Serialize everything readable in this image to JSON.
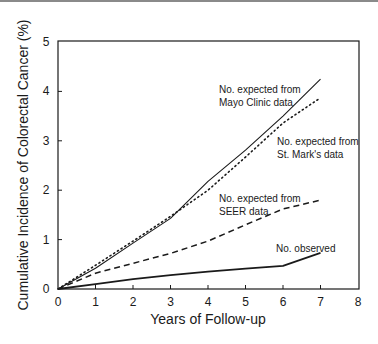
{
  "chart_data": {
    "type": "line",
    "title": "",
    "xlabel": "Years of Follow-up",
    "ylabel": "Cumulative Incidence of Colorectal Cancer (%)",
    "xlim": [
      0,
      8
    ],
    "ylim": [
      0,
      5
    ],
    "xticks": [
      0,
      1,
      2,
      3,
      4,
      5,
      6,
      7,
      8
    ],
    "yticks": [
      0,
      1,
      2,
      3,
      4,
      5
    ],
    "grid": false,
    "legend": "inline annotations",
    "x": [
      0,
      1,
      2,
      3,
      4,
      5,
      6,
      7
    ],
    "series": [
      {
        "name": "No. expected from Mayo Clinic data",
        "style": "solid-thin",
        "values": [
          0,
          0.42,
          0.93,
          1.43,
          2.18,
          2.81,
          3.5,
          4.25
        ]
      },
      {
        "name": "No. expected from St. Mark's data",
        "style": "dotted",
        "values": [
          0,
          0.48,
          0.97,
          1.47,
          2.0,
          2.67,
          3.36,
          3.87
        ]
      },
      {
        "name": "No. expected from SEER data",
        "style": "dashed",
        "values": [
          0,
          0.32,
          0.52,
          0.72,
          0.97,
          1.3,
          1.62,
          1.8
        ]
      },
      {
        "name": "No. observed",
        "style": "solid-thick",
        "values": [
          0,
          0.1,
          0.2,
          0.28,
          0.35,
          0.41,
          0.47,
          0.73
        ]
      }
    ],
    "annotations": [
      {
        "lines": [
          "No. expected from",
          "Mayo Clinic data"
        ],
        "x": 219,
        "y": 93
      },
      {
        "lines": [
          "No. expected from",
          "St. Mark's data"
        ],
        "x": 277,
        "y": 145
      },
      {
        "lines": [
          "No. expected from",
          "SEER data"
        ],
        "x": 219,
        "y": 202
      },
      {
        "lines": [
          "No. observed"
        ],
        "x": 276,
        "y": 252
      }
    ]
  }
}
